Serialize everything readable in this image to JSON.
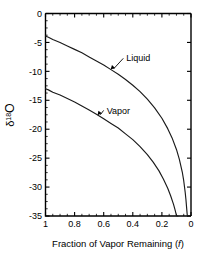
{
  "chart_data": {
    "type": "line",
    "title": "",
    "xlabel": "Fraction of Vapor Remaining (f)",
    "xlabel_main": "Fraction of Vapor Remaining (",
    "xlabel_italic": "f",
    "xlabel_tail": ")",
    "ylabel": "δ¹⁸O",
    "ylabel_delta": "δ",
    "ylabel_sup": "18",
    "ylabel_element": "O",
    "xlim": [
      1,
      0
    ],
    "ylim": [
      -35,
      0
    ],
    "x_reversed": true,
    "grid": false,
    "legend_position": "inline-annotations",
    "xticks": [
      1,
      0.8,
      0.6,
      0.4,
      0.2,
      0
    ],
    "xtick_labels": [
      "1",
      "0.8",
      "0.6",
      "0.4",
      "0.2",
      "0"
    ],
    "x_minor_step": 0.05,
    "yticks": [
      0,
      -5,
      -10,
      -15,
      -20,
      -25,
      -30,
      -35
    ],
    "ytick_labels": [
      "0",
      "-5",
      "-10",
      "-15",
      "-20",
      "-25",
      "-30",
      "-35"
    ],
    "y_minor_step": 1.25,
    "series": [
      {
        "name": "Liquid",
        "color": "#1a1a1a",
        "x": [
          1.0,
          0.98,
          0.95,
          0.9,
          0.85,
          0.8,
          0.75,
          0.7,
          0.65,
          0.6,
          0.55,
          0.5,
          0.45,
          0.4,
          0.35,
          0.3,
          0.25,
          0.2,
          0.16,
          0.13,
          0.1,
          0.08,
          0.06,
          0.05,
          0.04,
          0.035,
          0.03,
          0.027,
          0.025
        ],
        "y": [
          -3.9,
          -4.1,
          -4.5,
          -5.0,
          -5.6,
          -6.2,
          -6.8,
          -7.5,
          -8.2,
          -8.9,
          -9.7,
          -10.5,
          -11.4,
          -12.4,
          -13.5,
          -14.8,
          -16.3,
          -18.1,
          -19.9,
          -21.5,
          -23.5,
          -25.2,
          -27.4,
          -28.9,
          -30.9,
          -32.1,
          -33.6,
          -34.5,
          -35.0
        ]
      },
      {
        "name": "Vapor",
        "color": "#1a1a1a",
        "x": [
          1.0,
          0.98,
          0.95,
          0.9,
          0.85,
          0.8,
          0.75,
          0.7,
          0.65,
          0.6,
          0.55,
          0.5,
          0.45,
          0.4,
          0.35,
          0.3,
          0.26,
          0.22,
          0.19,
          0.16,
          0.14,
          0.12,
          0.11,
          0.1,
          0.095,
          0.09
        ],
        "y": [
          -13.0,
          -13.2,
          -13.6,
          -14.1,
          -14.7,
          -15.3,
          -16.0,
          -16.7,
          -17.4,
          -18.2,
          -19.0,
          -19.8,
          -20.8,
          -21.8,
          -23.0,
          -24.4,
          -25.7,
          -27.2,
          -28.6,
          -30.2,
          -31.5,
          -33.0,
          -33.9,
          -34.9,
          -35.0,
          -35.0
        ]
      }
    ],
    "annotations": [
      {
        "text": "Liquid",
        "label_x": 0.455,
        "label_y": -8.2,
        "point_x": 0.555,
        "point_y": -9.7
      },
      {
        "text": "Vapor",
        "label_x": 0.59,
        "label_y": -17.2,
        "point_x": 0.645,
        "point_y": -17.6
      }
    ]
  }
}
